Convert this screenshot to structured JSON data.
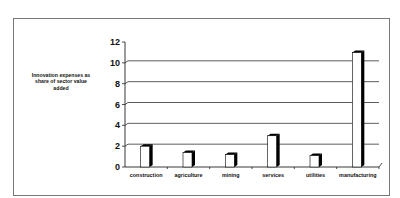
{
  "chart_data": {
    "type": "bar",
    "title": "",
    "xlabel": "",
    "ylabel": "Innovation expenses as share of sector value added",
    "ylabel_lines": [
      "Innovation expenses as",
      "share of  sector  value",
      "added"
    ],
    "categories": [
      "construction",
      "agriculture",
      "mining",
      "services",
      "utilities",
      "manufacturing"
    ],
    "values": [
      2.0,
      1.4,
      1.2,
      3.0,
      1.1,
      11.0
    ],
    "ylim": [
      0,
      12
    ],
    "yticks": [
      0,
      2,
      4,
      6,
      8,
      10,
      12
    ],
    "grid": true,
    "legend": null,
    "style": "3d-shaded-bars"
  },
  "colors": {
    "bar_face": "#ffffff",
    "bar_side": "#000000",
    "axis": "#222222",
    "grid": "#333333",
    "frame": "#777777"
  }
}
